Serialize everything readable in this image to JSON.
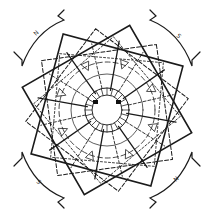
{
  "diagram": {
    "title": "",
    "type": "four-pole motor winding diagram",
    "poles": [
      {
        "label": "N",
        "position": "top-left",
        "x": 36,
        "y": 34
      },
      {
        "label": "S",
        "position": "top-right",
        "x": 178,
        "y": 34
      },
      {
        "label": "S",
        "position": "bottom-left",
        "x": 36,
        "y": 180
      },
      {
        "label": "N",
        "position": "bottom-right",
        "x": 178,
        "y": 180
      }
    ],
    "center": {
      "x": 107,
      "y": 110
    },
    "colors": {
      "line": "#1a1a1a",
      "background": "#ffffff"
    }
  }
}
